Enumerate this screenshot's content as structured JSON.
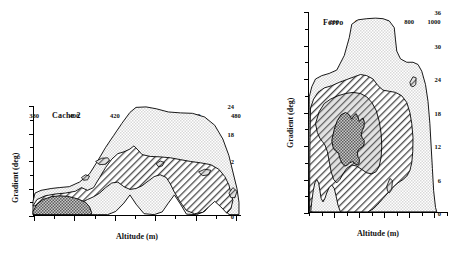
{
  "figure": {
    "panels": [
      "cache2",
      "ferro"
    ]
  },
  "chart_data": [
    {
      "type": "contour",
      "title": "Cache 2",
      "xlabel": "Altitude (m)",
      "ylabel": "Gradient (deg)",
      "xlim": [
        380,
        483
      ],
      "ylim": [
        0,
        24
      ],
      "xticks": [
        380,
        400,
        420,
        440,
        460,
        480
      ],
      "xticklabels": [
        "380",
        "400",
        "420",
        "440",
        "460",
        "480"
      ],
      "xminor_step": 10,
      "yticks": [
        0,
        6,
        12,
        18,
        24
      ],
      "yticklabels": [
        "0",
        "6",
        "12",
        "18",
        "24"
      ],
      "yminor_step": 3,
      "grid": false,
      "legend": "none",
      "levels": [
        {
          "name": "outer",
          "fill": "light-stipple",
          "description": "lowest density contour"
        },
        {
          "name": "middle",
          "fill": "diagonal-hatch",
          "description": "intermediate density contour"
        },
        {
          "name": "inner",
          "fill": "dark-stipple",
          "description": "highest density core"
        }
      ],
      "contours": {
        "outer": "380,3.2 381,5.0 384,5.6 389,6.0 393,6.2 398,6.4 403,7.4 408,9.2 412,12.0 416,15.0 420,17.6 424,20.2 428,22.6 431,23.7 436,23.8 441,23.4 447,22.7 453,22.5 459,22.4 465,21.6 470,19.8 474,16.8 477,13.2 479,9.6 481,6.0 482,3.0 482,0.3 477,0.3 474,2.2 471,4.2 468,2.6 465,1.0 461,0.3 456,0.4 453,2.6 450,4.6 447,2.8 444,0.9 440,0.3 435,0.5 431,2.6 428,4.6 425,2.8 421,1.0 417,0.3 412,0.3 409,0.3 405,0.3 398,0.3 391,0.3 385,0.3 380,0.3",
        "middle": "380,2.2 382,3.6 386,4.4 391,4.8 396,5.0 401,5.4 404,6.2 407,5.6 410,6.2 413,8.4 416,10.6 419,12.4 422,13.6 425,14.0 428,14.6 430,15.3 432,14.4 434,13.4 438,13.0 443,12.9 448,12.7 453,12.3 458,11.9 463,11.6 468,11.2 472,10.2 475,8.6 477,6.8 478,5.0 479,3.4 478,1.6 476,0.6 473,2.0 470,3.2 467,2.0 464,0.8 460,0.5 456,1.2 453,3.0 450,5.2 448,7.0 446,8.4 443,9.0 440,8.6 437,7.6 434,6.6 431,6.0 428,5.8 425,6.4 422,7.4 419,7.2 416,6.2 413,5.0 410,4.2 407,3.6 404,3.0 400,2.6 395,2.4 390,2.3 385,2.2 380,2.2",
        "inner": "380,1.0 382,2.6 385,3.6 389,4.2 393,4.4 397,4.3 400,4.0 403,3.6 406,3.0 408,2.0 409,0.8 409,0.3 405,0.3 400,0.3 394,0.3 388,0.3 383,0.3 380,0.3",
        "islets": [
          "411,11.9 414,12.6 417,12.7 418,12.1 416,11.3 413,11.2",
          "404,8.4 406,9.0 408,8.7 407,7.9 405,7.8",
          "441,11.4 443,12.0 445,11.7 444,10.9 442,10.8",
          "462,9.6 465,10.2 468,10.0 467,9.0 464,8.8",
          "477,5.0 479,6.2 481,5.4 480,4.0 478,4.0"
        ]
      }
    },
    {
      "type": "contour",
      "title": "Ferro",
      "xlabel": "Altitude (m)",
      "ylabel": "Gradient (deg)",
      "xlim": [
        0,
        1120
      ],
      "ylim": [
        0,
        36
      ],
      "xticks": [
        200,
        400,
        600,
        800,
        1000
      ],
      "xticklabels": [
        "200",
        "400",
        "600",
        "800",
        "1000"
      ],
      "xminor_step": 100,
      "yticks": [
        0,
        6,
        12,
        18,
        24,
        30,
        36
      ],
      "yticklabels": [
        "0",
        "6",
        "12",
        "18",
        "24",
        "30",
        "36"
      ],
      "yminor_step": 3,
      "grid": false,
      "legend": "none",
      "levels": [
        {
          "name": "outer",
          "fill": "light-stipple",
          "description": "lowest density contour"
        },
        {
          "name": "middle",
          "fill": "diagonal-hatch",
          "description": "intermediate density contour"
        },
        {
          "name": "inner",
          "fill": "dark-stipple",
          "description": "highest density core"
        }
      ],
      "contours": {
        "outer": "10,20.8 30,22.6 60,24.0 110,24.6 170,25.0 230,25.6 290,28.2 330,31.4 350,33.8 400,34.6 470,34.8 540,34.9 600,34.8 650,34.4 690,33.2 700,31.0 710,29.0 740,27.6 790,27.0 840,27.0 880,26.6 910,25.4 940,23.0 960,20.0 975,16.0 985,12.0 995,8.0 1005,4.0 1020,1.0 1030,0.2 960,0.2 900,0.2 840,0.2 780,0.2 700,0.2 620,0.2 540,0.2 460,0.2 380,0.2 300,0.2 220,0.2 150,0.2 90,0.2 40,0.2 12,0.3 8,3.0 6,8.0 6,13.0 8,17.0 10,20.8",
        "middle": "20,18.8 45,20.4 80,21.6 130,22.4 190,22.8 250,23.4 310,23.9 370,24.4 420,24.8 470,24.6 520,24.0 560,22.8 600,22.0 650,21.8 700,21.6 750,21.0 790,19.8 815,18.0 830,16.0 840,13.5 838,11.0 830,9.0 815,7.6 790,6.6 760,6.0 720,5.4 680,4.6 640,3.6 600,2.6 560,1.6 520,0.7 480,0.2 430,0.2 380,0.2 330,0.2 290,0.2 260,0.2 240,1.4 225,3.0 210,4.4 190,5.0 170,4.6 150,3.6 135,2.6 120,2.0 105,2.6 95,4.0 85,5.4 70,6.0 55,5.4 42,4.0 32,2.4 25,1.0 22,0.2 14,0.2 13,4.0 14,9.0 16,13.5 20,18.8",
        "inner_mid": "60,16.0 90,18.2 130,19.6 180,20.4 240,21.0 300,21.4 360,21.6 420,21.4 470,20.8 510,19.8 545,18.4 570,16.4 585,14.2 590,12.0 585,10.0 570,8.4 545,7.4 510,7.0 470,7.2 430,7.8 390,8.4 350,8.6 310,8.0 280,7.0 255,6.0 230,5.4 205,6.0 185,7.4 170,9.2 155,11.0 135,12.2 115,12.8 95,13.4 75,14.4 60,16.0",
        "inner": "190,13.0 210,15.0 235,16.6 265,17.6 300,18.0 330,17.6 350,16.8 365,17.4 385,17.8 400,17.2 410,16.4 425,16.8 440,17.0 450,16.4 448,15.4 435,14.8 425,14.0 435,13.4 450,13.0 448,12.2 435,11.8 420,11.6 405,11.4 395,10.8 400,10.0 412,9.6 408,8.8 392,8.6 375,8.8 355,9.2 335,9.0 315,8.6 295,8.4 275,8.8 258,9.6 245,10.6 230,11.0 215,11.2 200,11.8 190,13.0",
        "islets": [
          "815,23.4 840,24.4 865,24.2 862,23.0 840,22.6 822,22.8",
          "630,4.8 655,6.2 675,5.8 670,4.2 650,3.6 636,3.9"
        ]
      }
    }
  ]
}
